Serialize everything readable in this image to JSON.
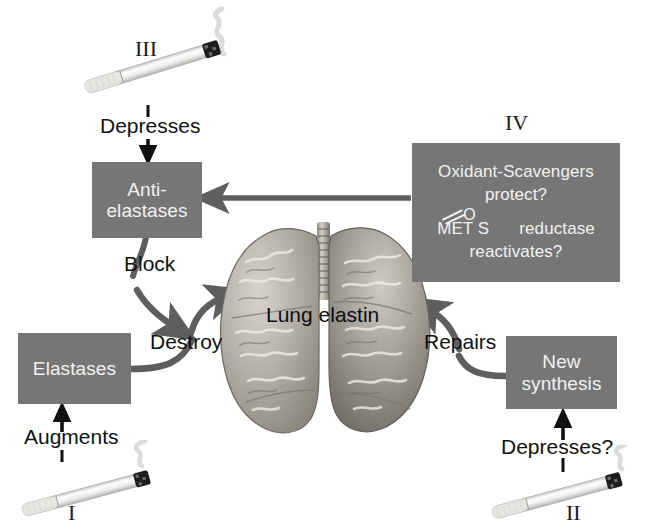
{
  "diagram": {
    "background_color": "#ffffff",
    "box_color": "#767676",
    "box_text_color": "#f2f2f2",
    "arrow_color": "#5e5e5e",
    "label_text_color": "#111111"
  },
  "boxes": {
    "anti_elastases": {
      "line1": "Anti-",
      "line2": "elastases"
    },
    "elastases": {
      "line1": "Elastases"
    },
    "new_synthesis": {
      "line1": "New",
      "line2": "synthesis"
    },
    "oxidant_scavengers": {
      "line1": "Oxidant-Scavengers",
      "line2": "protect?",
      "line3_pre": "MET S",
      "line3_oxygen": "O",
      "line3_post": "reductase",
      "line4": "reactivates?"
    }
  },
  "center": {
    "lung_label": "Lung elastin",
    "organ_icon": "lungs-illustration"
  },
  "arrow_labels": {
    "depresses_top": "Depresses",
    "block": "Block",
    "destroy": "Destroy",
    "augments": "Augments",
    "repairs": "Repairs",
    "depresses_bottom": "Depresses?"
  },
  "roman_numerals": {
    "one": "I",
    "two": "II",
    "three": "III",
    "four": "IV"
  },
  "cigarettes": [
    {
      "id": "cigarette-i",
      "numeral": "I",
      "position": "bottom-left"
    },
    {
      "id": "cigarette-ii",
      "numeral": "II",
      "position": "bottom-right"
    },
    {
      "id": "cigarette-iii",
      "numeral": "III",
      "position": "top-left"
    }
  ]
}
